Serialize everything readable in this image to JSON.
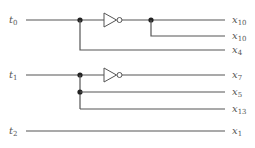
{
  "diagram": {
    "type": "logic-circuit",
    "inputs": [
      {
        "id": "t0",
        "base": "t",
        "sub": "0"
      },
      {
        "id": "t1",
        "base": "t",
        "sub": "1"
      },
      {
        "id": "t2",
        "base": "t",
        "sub": "2"
      }
    ],
    "outputs": [
      {
        "id": "o1",
        "base": "x",
        "sub": "10",
        "source": "NOT t0"
      },
      {
        "id": "o2",
        "base": "x",
        "sub": "10",
        "source": "NOT t0"
      },
      {
        "id": "o3",
        "base": "x",
        "sub": "4",
        "source": "t0"
      },
      {
        "id": "o4",
        "base": "x",
        "sub": "7",
        "source": "NOT t1"
      },
      {
        "id": "o5",
        "base": "x",
        "sub": "5",
        "source": "t1"
      },
      {
        "id": "o6",
        "base": "x",
        "sub": "13",
        "source": "t1"
      },
      {
        "id": "o7",
        "base": "x",
        "sub": "1",
        "source": "t2"
      }
    ],
    "gates": [
      {
        "id": "inv0",
        "kind": "NOT",
        "input": "t0"
      },
      {
        "id": "inv1",
        "kind": "NOT",
        "input": "t1"
      }
    ],
    "colors": {
      "wire": "#555555",
      "junction": "#222222",
      "label": "#555555"
    }
  }
}
